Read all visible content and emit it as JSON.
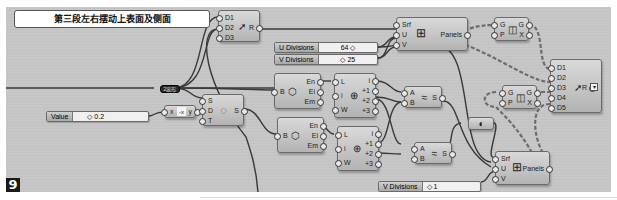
{
  "canvas": {
    "background": "#c7c7c7",
    "wire_color": "#3a3a3a",
    "dashed_wire_color": "#6d6d6d"
  },
  "group": {
    "title": "第三段左右摆动上表面及侧面"
  },
  "relay": {
    "label": "2波形"
  },
  "figure_badge": "9",
  "nodes": {
    "merge_top": {
      "inputs": [
        "D1",
        "D2",
        "D3"
      ],
      "output": "R",
      "icon": "merge-icon"
    },
    "u_div_slider": {
      "label": "U Divisions",
      "value": "64 ◇"
    },
    "v_div_slider_top": {
      "label": "V Divisions",
      "value": "◇ 25"
    },
    "panels_top": {
      "inputs": [
        "Srf",
        "U",
        "V"
      ],
      "output": "Panels",
      "icon": "grid-icon"
    },
    "dispatch_top": {
      "inputs": [
        "G",
        "P"
      ],
      "outputs": [
        "G",
        "X"
      ],
      "icon": "dispatch-icon"
    },
    "merge_right": {
      "inputs": [
        "D1",
        "D2",
        "D3",
        "D4",
        "D5"
      ],
      "output": "R",
      "icon": "merge-icon"
    },
    "dispatch_mid": {
      "inputs": [
        "G",
        "P"
      ],
      "outputs": [
        "G",
        "X"
      ],
      "icon": "dispatch-icon"
    },
    "value_slider": {
      "label": "Value",
      "value": "◇ 0.2"
    },
    "negative": {
      "input": "x",
      "output": "y",
      "icon": "negative-icon"
    },
    "series": {
      "inputs": [
        "S",
        "D",
        "T"
      ],
      "output": "S",
      "icon": "series-icon"
    },
    "brep_edges_1": {
      "input": "B",
      "outputs": [
        "En",
        "Ei",
        "Em"
      ],
      "icon": "box-icon"
    },
    "brep_edges_2": {
      "input": "B",
      "outputs": [
        "En",
        "Ei",
        "Em"
      ],
      "icon": "box-icon"
    },
    "list_item_1": {
      "inputs": [
        "L",
        "i",
        "W"
      ],
      "outputs": [
        "i",
        "+1",
        "+2",
        "+3"
      ],
      "icon": "list-item-icon"
    },
    "list_item_2": {
      "inputs": [
        "L",
        "i",
        "W"
      ],
      "outputs": [
        "i",
        "+1",
        "+2",
        "+3"
      ],
      "icon": "list-item-icon"
    },
    "loft_1": {
      "inputs": [
        "A",
        "B"
      ],
      "output": "S",
      "icon": "ruled-surface-icon"
    },
    "loft_2": {
      "inputs": [
        "A",
        "B"
      ],
      "output": "S",
      "icon": "ruled-surface-icon"
    },
    "flip": {
      "icon": "flip-icon"
    },
    "panels_bottom": {
      "inputs": [
        "Srf",
        "U",
        "V"
      ],
      "output": "Panels",
      "icon": "grid-icon"
    },
    "v_div_slider_bottom": {
      "label": "V Divisions",
      "value": "◇ 1"
    }
  }
}
